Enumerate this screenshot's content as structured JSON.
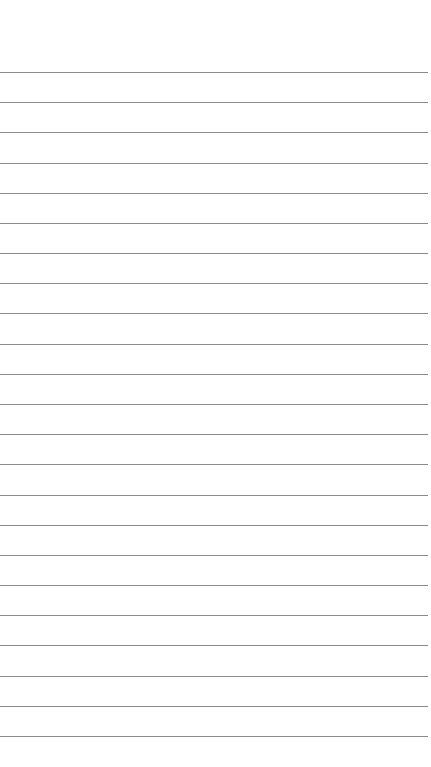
{
  "page": {
    "type": "lined-paper",
    "line_count": 23,
    "first_line_y": 72,
    "line_spacing": 30.18,
    "line_color": "#8a8a8a",
    "background": "#ffffff"
  }
}
